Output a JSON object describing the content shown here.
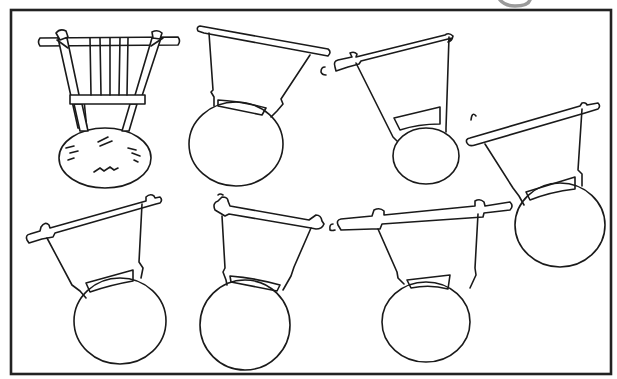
{
  "figure": {
    "width": 617,
    "height": 379,
    "background": "#ffffff",
    "ink_color": "#1a1a1a",
    "frame": {
      "x": 11,
      "y": 10,
      "width": 600,
      "height": 364
    },
    "corner_mark": {
      "description": "grey partial mark above top-right frame edge",
      "x": 490,
      "y": 0
    },
    "instruments": [
      {
        "id": "detailed-harp",
        "label": "Detailed harp with strings and textured gourd body",
        "count_strings": 5
      },
      {
        "id": "harp-outline-1",
        "label": "Harp outline, top row 2"
      },
      {
        "id": "harp-outline-2",
        "label": "Harp outline, top row 3"
      },
      {
        "id": "harp-outline-3",
        "label": "Harp outline, right tilted"
      },
      {
        "id": "harp-outline-4",
        "label": "Harp outline, bottom row 1"
      },
      {
        "id": "harp-outline-5",
        "label": "Harp outline, bottom row 2"
      },
      {
        "id": "harp-outline-6",
        "label": "Harp outline, bottom row 3"
      }
    ]
  }
}
